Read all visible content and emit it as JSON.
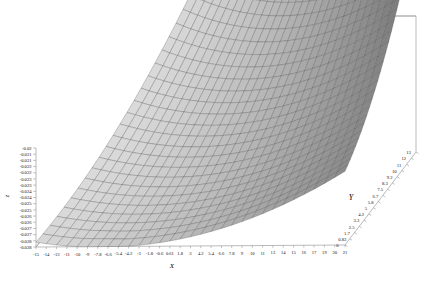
{
  "chart_data": {
    "type": "surface",
    "title": "",
    "subtitle": "",
    "xlabel": "X",
    "ylabel": "Y",
    "zlabel": "z",
    "grid": true,
    "legend": "none",
    "projection": "3d",
    "surface_color": "#b4b4b4",
    "mesh_color": "#6e6e6e",
    "frame_color": "#9a9a9a",
    "background": "#ffffff",
    "xlim": [
      -15,
      21
    ],
    "ylim": [
      0,
      13
    ],
    "zlim": [
      -0.028,
      -0.02
    ],
    "x_ticks": [
      "-15",
      "-14",
      "-13",
      "-11",
      "-10",
      "-9",
      "-7.8",
      "-6.6",
      "-5.4",
      "-4.2",
      "-3",
      "-1.8",
      "-0.6",
      "0.61",
      "1.8",
      "3",
      "4.2",
      "5.4",
      "6.6",
      "7.8",
      "9",
      "10",
      "11",
      "13",
      "14",
      "15",
      "16",
      "17",
      "19",
      "20",
      "21"
    ],
    "y_ticks": [
      "0",
      "0.83",
      "1.7",
      "2.5",
      "3.3",
      "4.2",
      "5",
      "5.8",
      "6.7",
      "7.5",
      "8.3",
      "9.2",
      "10",
      "11",
      "12",
      "13"
    ],
    "z_ticks": [
      "-0.02",
      "-0.021",
      "-0.021",
      "-0.022",
      "-0.022",
      "-0.023",
      "-0.023",
      "-0.024",
      "-0.024",
      "-0.025",
      "-0.025",
      "-0.026",
      "-0.026",
      "-0.027",
      "-0.027",
      "-0.028",
      "-0.028"
    ],
    "surface_rows": 26,
    "surface_cols": 30
  },
  "axes": {
    "x": {
      "label": "X",
      "label_x": 172,
      "label_y": 268,
      "ticks": [
        "-15",
        "-14",
        "-13",
        "-11",
        "-10",
        "-9",
        "-7.8",
        "-6.6",
        "-5.4",
        "-4.2",
        "-3",
        "-1.8",
        "-0.6",
        "0.61",
        "1.8",
        "3",
        "4.2",
        "5.4",
        "6.6",
        "7.8",
        "9",
        "10",
        "11",
        "13",
        "14",
        "15",
        "16",
        "17",
        "19",
        "20",
        "21"
      ]
    },
    "y": {
      "label": "Y",
      "label_x": 351,
      "label_y": 200,
      "ticks": [
        "0",
        "0.83",
        "1.7",
        "2.5",
        "3.3",
        "4.2",
        "5",
        "5.8",
        "6.7",
        "7.5",
        "8.3",
        "9.2",
        "10",
        "11",
        "12",
        "13"
      ]
    },
    "z": {
      "label": "z",
      "label_x": 9,
      "label_y": 196,
      "ticks": [
        "-0.02",
        "-0.021",
        "-0.021",
        "-0.022",
        "-0.022",
        "-0.023",
        "-0.023",
        "-0.024",
        "-0.024",
        "-0.025",
        "-0.025",
        "-0.026",
        "-0.026",
        "-0.027",
        "-0.027",
        "-0.028",
        "-0.028"
      ]
    }
  }
}
